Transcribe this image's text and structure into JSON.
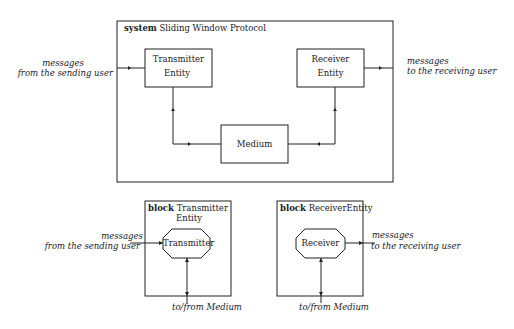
{
  "system": {
    "keyword": "system",
    "title": "Sliding Window Protocol",
    "transmitter": {
      "line1": "Transmitter",
      "line2": "Entity"
    },
    "receiver": {
      "line1": "Receiver",
      "line2": "Entity"
    },
    "medium": "Medium",
    "input": {
      "line1": "messages",
      "line2": "from the sending user"
    },
    "output": {
      "line1": "messages",
      "line2": "to the receiving user"
    }
  },
  "block_transmitter": {
    "keyword": "block",
    "title_line1": "Transmitter",
    "title_line2": "Entity",
    "process": "Transmitter",
    "input": {
      "line1": "messages",
      "line2": "from the sending user"
    },
    "bottom": "to/from Medium"
  },
  "block_receiver": {
    "keyword": "block",
    "title": "ReceiverEntity",
    "process": "Receiver",
    "output": {
      "line1": "messages",
      "line2": "to the receiving user"
    },
    "bottom": "to/from Medium"
  },
  "colors": {
    "stroke": "#222222",
    "background": "#ffffff"
  }
}
